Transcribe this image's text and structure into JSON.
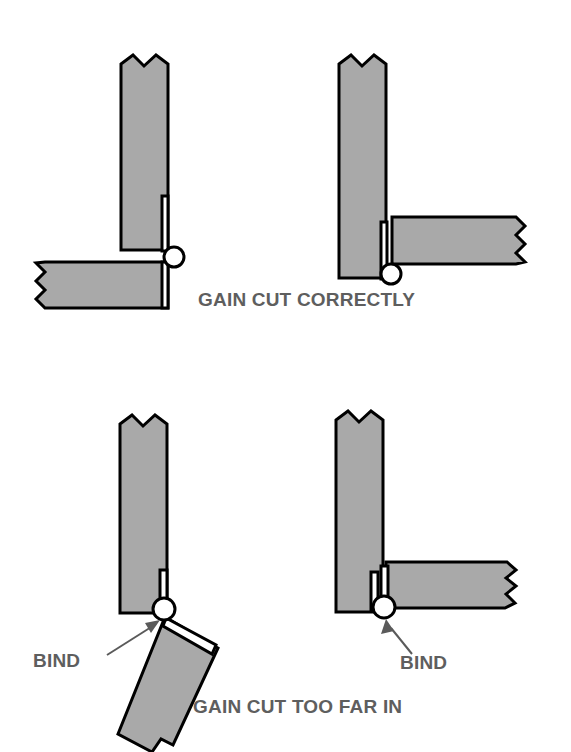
{
  "figure": {
    "title_visible": false,
    "background_color": "#ffffff",
    "wood_fill_color": "#a9a9a9",
    "outline_color": "#000000",
    "label_color": "#5e5e5e",
    "hinge_leaf_color": "#ffffff"
  },
  "captions": {
    "top": "GAIN CUT CORRECTLY",
    "bottom": "GAIN CUT TOO FAR IN"
  },
  "callouts": {
    "bottom_left": "BIND",
    "bottom_right": "BIND"
  },
  "panels": [
    {
      "id": "top-left",
      "name": "gain-cut-correctly-door-open",
      "condition": "GAIN CUT CORRECTLY",
      "door_state": "open",
      "door_angle_degrees": 90,
      "binds": false,
      "parts": [
        "jamb",
        "door",
        "hinge-leaf",
        "hinge-knuckle"
      ]
    },
    {
      "id": "top-right",
      "name": "gain-cut-correctly-door-closed",
      "condition": "GAIN CUT CORRECTLY",
      "door_state": "closed",
      "door_angle_degrees": 0,
      "binds": false,
      "parts": [
        "jamb",
        "door",
        "hinge-leaf",
        "hinge-knuckle"
      ]
    },
    {
      "id": "bottom-left",
      "name": "gain-cut-too-far-in-door-open",
      "condition": "GAIN CUT TOO FAR IN",
      "door_state": "open",
      "door_angle_degrees": 70,
      "binds": true,
      "bind_label": "BIND",
      "parts": [
        "jamb",
        "door",
        "hinge-leaf",
        "hinge-knuckle",
        "bind-arrow"
      ]
    },
    {
      "id": "bottom-right",
      "name": "gain-cut-too-far-in-door-closed",
      "condition": "GAIN CUT TOO FAR IN",
      "door_state": "closed",
      "door_angle_degrees": 5,
      "binds": true,
      "bind_label": "BIND",
      "parts": [
        "jamb",
        "door",
        "hinge-leaf",
        "hinge-knuckle",
        "bind-arrow"
      ]
    }
  ]
}
